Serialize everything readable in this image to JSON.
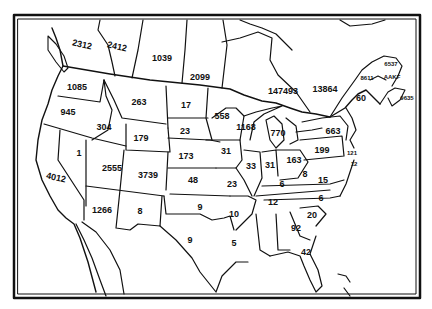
{
  "map": {
    "title": "",
    "frame": {
      "x": 14,
      "y": 15,
      "width": 406,
      "height": 283,
      "stroke": "#111111"
    },
    "colors": {
      "background": "#ffffff",
      "ink": "#111111"
    },
    "regions": [
      {
        "id": "british-columbia",
        "label": "2312",
        "x": 82,
        "y": 45,
        "tilt": true
      },
      {
        "id": "alberta",
        "label": "2412",
        "x": 117,
        "y": 47,
        "tilt": true
      },
      {
        "id": "saskatchewan",
        "label": "1039",
        "x": 162,
        "y": 58
      },
      {
        "id": "manitoba",
        "label": "2099",
        "x": 200,
        "y": 77
      },
      {
        "id": "ontario",
        "label": "147493",
        "x": 283,
        "y": 91
      },
      {
        "id": "quebec",
        "label": "13864",
        "x": 325,
        "y": 89
      },
      {
        "id": "new-brunswick",
        "label": "8611",
        "x": 367,
        "y": 78,
        "small": true
      },
      {
        "id": "pei",
        "label": "6537",
        "x": 391,
        "y": 64,
        "small": true
      },
      {
        "id": "nova-scotia-north",
        "label": "AAKF",
        "x": 392,
        "y": 77,
        "small": true
      },
      {
        "id": "nova-scotia",
        "label": "9635",
        "x": 407,
        "y": 98,
        "small": true
      },
      {
        "id": "maine",
        "label": "60",
        "x": 361,
        "y": 98,
        "small": false
      },
      {
        "id": "washington",
        "label": "1085",
        "x": 77,
        "y": 87
      },
      {
        "id": "oregon",
        "label": "945",
        "x": 68,
        "y": 112
      },
      {
        "id": "idaho",
        "label": "304",
        "x": 104,
        "y": 127
      },
      {
        "id": "montana",
        "label": "263",
        "x": 139,
        "y": 102
      },
      {
        "id": "wyoming",
        "label": "179",
        "x": 141,
        "y": 138
      },
      {
        "id": "north-dakota",
        "label": "17",
        "x": 186,
        "y": 105
      },
      {
        "id": "south-dakota",
        "label": "23",
        "x": 185,
        "y": 131
      },
      {
        "id": "minnesota",
        "label": "558",
        "x": 222,
        "y": 116
      },
      {
        "id": "wisconsin",
        "label": "1168",
        "x": 246,
        "y": 127
      },
      {
        "id": "michigan",
        "label": "770",
        "x": 278,
        "y": 133
      },
      {
        "id": "nevada",
        "label": "1",
        "x": 79,
        "y": 153
      },
      {
        "id": "california",
        "label": "4012",
        "x": 56,
        "y": 178,
        "tilt": true
      },
      {
        "id": "utah",
        "label": "2555",
        "x": 112,
        "y": 168
      },
      {
        "id": "colorado",
        "label": "3739",
        "x": 148,
        "y": 175
      },
      {
        "id": "nebraska",
        "label": "173",
        "x": 186,
        "y": 156
      },
      {
        "id": "iowa",
        "label": "31",
        "x": 226,
        "y": 151
      },
      {
        "id": "illinois",
        "label": "33",
        "x": 251,
        "y": 166
      },
      {
        "id": "indiana",
        "label": "31",
        "x": 270,
        "y": 165
      },
      {
        "id": "ohio",
        "label": "163",
        "x": 294,
        "y": 160
      },
      {
        "id": "pennsylvania",
        "label": "199",
        "x": 322,
        "y": 150
      },
      {
        "id": "new-york",
        "label": "663",
        "x": 333,
        "y": 131
      },
      {
        "id": "new-jersey",
        "label": "121",
        "x": 352,
        "y": 153,
        "small": true
      },
      {
        "id": "delaware-maryland",
        "label": "12",
        "x": 354,
        "y": 164,
        "small": true
      },
      {
        "id": "west-virginia",
        "label": "8",
        "x": 305,
        "y": 174
      },
      {
        "id": "virginia",
        "label": "15",
        "x": 323,
        "y": 180
      },
      {
        "id": "kansas",
        "label": "48",
        "x": 193,
        "y": 180
      },
      {
        "id": "missouri",
        "label": "23",
        "x": 232,
        "y": 184
      },
      {
        "id": "kentucky",
        "label": "6",
        "x": 282,
        "y": 184
      },
      {
        "id": "arizona",
        "label": "1266",
        "x": 102,
        "y": 210
      },
      {
        "id": "new-mexico",
        "label": "8",
        "x": 140,
        "y": 211
      },
      {
        "id": "oklahoma",
        "label": "9",
        "x": 200,
        "y": 207
      },
      {
        "id": "texas",
        "label": "9",
        "x": 190,
        "y": 240
      },
      {
        "id": "arkansas",
        "label": "10",
        "x": 234,
        "y": 214
      },
      {
        "id": "tennessee",
        "label": "12",
        "x": 273,
        "y": 202
      },
      {
        "id": "north-carolina",
        "label": "6",
        "x": 321,
        "y": 198
      },
      {
        "id": "south-carolina",
        "label": "20",
        "x": 312,
        "y": 215
      },
      {
        "id": "georgia",
        "label": "92",
        "x": 296,
        "y": 228
      },
      {
        "id": "louisiana",
        "label": "5",
        "x": 234,
        "y": 243
      },
      {
        "id": "florida",
        "label": "42",
        "x": 306,
        "y": 252
      }
    ]
  }
}
